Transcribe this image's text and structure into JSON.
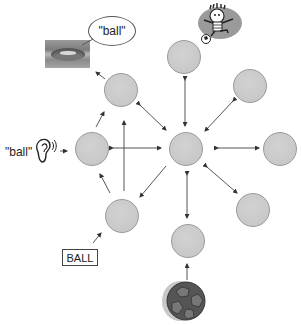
{
  "diagram": {
    "type": "semantic-network",
    "hub_node": {
      "id": "center",
      "label": ""
    },
    "nodes": [
      {
        "id": "center",
        "x": 186,
        "y": 149
      },
      {
        "id": "top",
        "x": 184,
        "y": 57
      },
      {
        "id": "top-right",
        "x": 250,
        "y": 86
      },
      {
        "id": "right",
        "x": 280,
        "y": 149
      },
      {
        "id": "bottom-right",
        "x": 253,
        "y": 210
      },
      {
        "id": "bottom",
        "x": 188,
        "y": 241
      },
      {
        "id": "lower-left",
        "x": 122,
        "y": 216
      },
      {
        "id": "left",
        "x": 92,
        "y": 149
      },
      {
        "id": "upper-left",
        "x": 121,
        "y": 90
      }
    ],
    "edges": [
      {
        "from": "center",
        "to": "top",
        "bidirectional": true
      },
      {
        "from": "center",
        "to": "top-right",
        "bidirectional": true
      },
      {
        "from": "center",
        "to": "right",
        "bidirectional": true
      },
      {
        "from": "center",
        "to": "bottom-right",
        "bidirectional": true
      },
      {
        "from": "center",
        "to": "bottom",
        "bidirectional": true
      },
      {
        "from": "center",
        "to": "left",
        "bidirectional": true
      },
      {
        "from": "center",
        "to": "upper-left",
        "bidirectional": false,
        "direction": "to-center"
      },
      {
        "from": "center",
        "to": "lower-left",
        "bidirectional": false,
        "direction": "to-lower-left"
      },
      {
        "from": "lower-left",
        "to": "upper-left",
        "bidirectional": false
      },
      {
        "from": "lower-left",
        "to": "left",
        "bidirectional": false
      },
      {
        "from": "left",
        "to": "upper-left",
        "bidirectional": false
      }
    ],
    "inputs": {
      "spoken_word": {
        "label": "\"ball\"",
        "icon": "ear-icon",
        "target": "left"
      },
      "written_word": {
        "label": "BALL",
        "target": "lower-left"
      },
      "visual_object": {
        "icon": "soccer-ball-icon",
        "target": "bottom"
      },
      "action_image": {
        "icon": "child-kicking-ball-icon"
      }
    },
    "outputs": {
      "speech": {
        "label": "\"ball\"",
        "icon": "lips-icon",
        "source": "upper-left"
      }
    },
    "colors": {
      "node_fill": "#c8c8c8",
      "node_border": "#9a9a9a",
      "arrow": "#333333",
      "background": "#ffffff"
    }
  }
}
